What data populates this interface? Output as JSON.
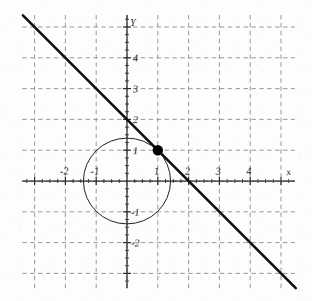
{
  "figure": {
    "kind": "cartesian-graph",
    "background_color": "#fdfdfd",
    "ink_color": "#1a1a1a",
    "grid_color": "#8d8d8d",
    "axis_color": "#2b2b2b"
  },
  "axes": {
    "x_axis_label": "x",
    "y_axis_label": "Y",
    "x_tick_labels": [
      "-2",
      "-1",
      "1",
      "2",
      "3",
      "4"
    ],
    "y_tick_labels": [
      "4",
      "3",
      "2",
      "1",
      "-1",
      "-2"
    ]
  },
  "chart_data": {
    "type": "line",
    "title": "",
    "xlabel": "x",
    "ylabel": "Y",
    "xlim": [
      -3.4,
      5.45
    ],
    "ylim": [
      -3.48,
      5.39
    ],
    "grid": true,
    "grid_spacing": 1,
    "legend": "none",
    "origin_px": [
      127,
      181
    ],
    "unit_px": 30.8,
    "series": [
      {
        "name": "line",
        "kind": "line",
        "equation": "y = -x + 2",
        "slope": -1,
        "intercept": 2,
        "x_intercept": 2,
        "y_intercept": 2,
        "endpoints": [
          [
            -3.38,
            5.38
          ],
          [
            5.48,
            -3.48
          ]
        ],
        "stroke_width": 2.6,
        "color": "#111111"
      },
      {
        "name": "circle",
        "kind": "circle",
        "equation": "x^2 + y^2 = 2",
        "center": [
          0,
          0
        ],
        "radius": 1.414,
        "stroke_width": 1.0,
        "color": "#222222"
      },
      {
        "name": "intersection-point",
        "kind": "scatter",
        "x": [
          1
        ],
        "y": [
          1
        ],
        "label": "(1, 1)",
        "marker": "filled-circle",
        "marker_radius_px": 5.2,
        "color": "#000000"
      }
    ],
    "x_ticks": [
      -2,
      -1,
      1,
      2,
      3,
      4
    ],
    "y_ticks": [
      4,
      3,
      2,
      1,
      -1,
      -2
    ],
    "x_gridlines": [
      -3,
      -2,
      -1,
      0,
      1,
      2,
      3,
      4,
      5
    ],
    "y_gridlines": [
      -3,
      -2,
      -1,
      0,
      1,
      2,
      3,
      4,
      5
    ]
  }
}
